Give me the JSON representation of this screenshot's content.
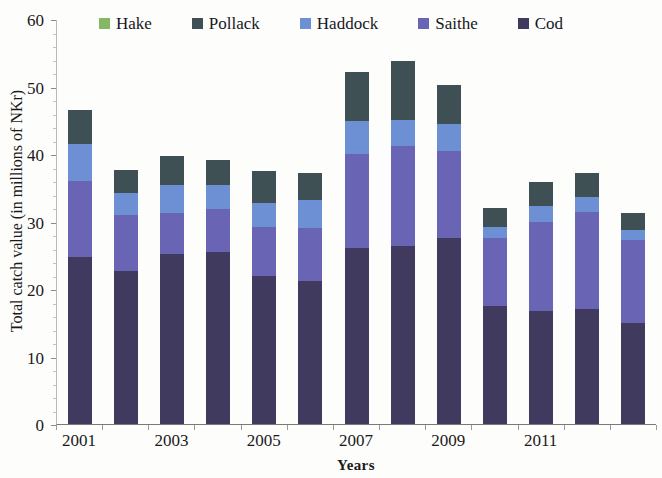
{
  "chart_data": {
    "type": "bar",
    "stacked": true,
    "title": "",
    "xlabel": "Years",
    "ylabel": "Total catch value (in millions of NKr)",
    "ylim": [
      0,
      60
    ],
    "ytick_labels": [
      "0",
      "10",
      "20",
      "30",
      "40",
      "50",
      "60"
    ],
    "ytick_values": [
      0,
      10,
      20,
      30,
      40,
      50,
      60
    ],
    "grid": false,
    "legend_position": "top-center",
    "categories": [
      "2001",
      "2002",
      "2003",
      "2004",
      "2005",
      "2006",
      "2007",
      "2008",
      "2009",
      "2010",
      "2011",
      "2012",
      "2013"
    ],
    "xtick_labels": [
      "2001",
      "2003",
      "2005",
      "2007",
      "2009",
      "2011"
    ],
    "xtick_label_indices": [
      0,
      2,
      4,
      6,
      8,
      10
    ],
    "series": [
      {
        "name": "Cod",
        "color": "#3f3a5e",
        "values": [
          24.8,
          22.6,
          25.2,
          25.5,
          22.0,
          21.2,
          26.1,
          26.4,
          27.5,
          17.5,
          16.8,
          17.0,
          14.9
        ]
      },
      {
        "name": "Saithe",
        "color": "#6a64b4",
        "values": [
          11.2,
          8.4,
          6.0,
          6.4,
          7.2,
          7.9,
          13.9,
          14.8,
          13.0,
          10.0,
          13.2,
          14.4,
          12.3
        ]
      },
      {
        "name": "Haddock",
        "color": "#6d8fd4",
        "values": [
          5.5,
          3.2,
          4.2,
          3.5,
          3.6,
          4.1,
          4.9,
          3.8,
          4.0,
          1.7,
          2.3,
          2.2,
          1.5
        ]
      },
      {
        "name": "Pollack",
        "color": "#3f5055",
        "values": [
          5.0,
          3.5,
          4.3,
          3.7,
          4.7,
          4.0,
          7.2,
          8.8,
          5.7,
          2.8,
          3.6,
          3.6,
          2.5
        ]
      },
      {
        "name": "Hake",
        "color": "#85b764",
        "values": [
          0.0,
          0.0,
          0.0,
          0.0,
          0.0,
          0.0,
          0.0,
          0.0,
          0.0,
          0.0,
          0.0,
          0.0,
          0.0
        ]
      }
    ],
    "totals": [
      46.5,
      37.7,
      39.7,
      39.1,
      37.5,
      37.2,
      52.1,
      53.8,
      50.2,
      32.0,
      35.9,
      37.2,
      31.2
    ]
  },
  "legend": {
    "items": [
      {
        "label": "Hake",
        "color": "#85b764"
      },
      {
        "label": "Pollack",
        "color": "#3f5055"
      },
      {
        "label": "Haddock",
        "color": "#6d8fd4"
      },
      {
        "label": "Saithe",
        "color": "#6a64b4"
      },
      {
        "label": "Cod",
        "color": "#3f3a5e"
      }
    ]
  },
  "axes": {
    "x_title": "Years",
    "y_title": "Total catch value (in millions of NKr)"
  }
}
